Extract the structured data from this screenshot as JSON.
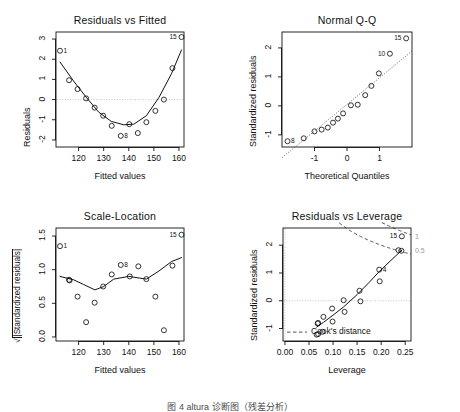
{
  "figure": {
    "caption": "图 4  altura 诊断图（残差分析）",
    "background": "#ffffff",
    "foreground": "#000000",
    "cook_color": "#9a9a9a",
    "guide_color": "#bdbdbd"
  },
  "panels": [
    {
      "id": "residuals-vs-fitted",
      "title": "Residuals vs Fitted",
      "xlabel": "Fitted values",
      "ylabel": "Residuals",
      "xticks": [
        "120",
        "130",
        "140",
        "150",
        "160"
      ],
      "yticks": [
        "3",
        "2",
        "1",
        "0",
        "-1",
        "-2"
      ]
    },
    {
      "id": "normal-qq",
      "title": "Normal Q-Q",
      "xlabel": "Theoretical Quantiles",
      "ylabel": "Standardized residuals",
      "xticks": [
        "-1",
        "0",
        "1"
      ],
      "yticks": [
        "2",
        "1",
        "0",
        "-1"
      ]
    },
    {
      "id": "scale-location",
      "title": "Scale-Location",
      "xlabel": "Fitted values",
      "ylabel": "|Standardized residuals|",
      "ylabel_prefix": "sqrt",
      "xticks": [
        "120",
        "130",
        "140",
        "150",
        "160"
      ],
      "yticks": [
        "1.5",
        "1.0",
        "0.5",
        "0.0"
      ]
    },
    {
      "id": "residuals-vs-leverage",
      "title": "Residuals vs Leverage",
      "xlabel": "Leverage",
      "ylabel": "Standardized residuals",
      "xticks": [
        "0.00",
        "0.05",
        "0.10",
        "0.15",
        "0.20",
        "0.25"
      ],
      "yticks": [
        "2",
        "1",
        "0",
        "-1"
      ],
      "legend": "Cook's distance",
      "cook_labels": [
        "1",
        "0.5"
      ]
    }
  ],
  "chart_data": [
    {
      "type": "scatter",
      "id": "residuals-vs-fitted",
      "title": "Residuals vs Fitted",
      "xlabel": "Fitted values",
      "ylabel": "Residuals",
      "xlim": [
        111,
        162
      ],
      "ylim": [
        -2.35,
        3.35
      ],
      "xticks": [
        120,
        130,
        140,
        150,
        160
      ],
      "yticks": [
        -2,
        -1,
        0,
        1,
        2,
        3
      ],
      "grid": false,
      "hline": 0,
      "points": [
        {
          "x": 112.6,
          "y": 2.42,
          "label": "1"
        },
        {
          "x": 116.2,
          "y": 0.96,
          "label": ""
        },
        {
          "x": 119.6,
          "y": 0.52,
          "label": ""
        },
        {
          "x": 123.0,
          "y": 0.06,
          "label": ""
        },
        {
          "x": 126.4,
          "y": -0.4,
          "label": ""
        },
        {
          "x": 129.8,
          "y": -0.8,
          "label": ""
        },
        {
          "x": 133.2,
          "y": -1.3,
          "label": ""
        },
        {
          "x": 136.8,
          "y": -1.8,
          "label": "8"
        },
        {
          "x": 140.2,
          "y": -1.22,
          "label": ""
        },
        {
          "x": 143.6,
          "y": -1.66,
          "label": ""
        },
        {
          "x": 147.0,
          "y": -1.12,
          "label": ""
        },
        {
          "x": 150.6,
          "y": -0.56,
          "label": ""
        },
        {
          "x": 154.0,
          "y": 0.0,
          "label": ""
        },
        {
          "x": 157.4,
          "y": 1.56,
          "label": ""
        },
        {
          "x": 161.0,
          "y": 3.1,
          "label": "15"
        }
      ],
      "smooth": [
        {
          "x": 112.6,
          "y": 1.86
        },
        {
          "x": 118.0,
          "y": 0.92
        },
        {
          "x": 123.0,
          "y": 0.12
        },
        {
          "x": 128.0,
          "y": -0.62
        },
        {
          "x": 133.0,
          "y": -1.08
        },
        {
          "x": 138.0,
          "y": -1.25
        },
        {
          "x": 142.0,
          "y": -1.22
        },
        {
          "x": 147.0,
          "y": -0.8
        },
        {
          "x": 152.0,
          "y": 0.1
        },
        {
          "x": 157.0,
          "y": 1.28
        },
        {
          "x": 161.0,
          "y": 2.46
        }
      ]
    },
    {
      "type": "scatter",
      "id": "normal-qq",
      "title": "Normal Q-Q",
      "xlabel": "Theoretical Quantiles",
      "ylabel": "Standardized residuals",
      "xlim": [
        -2.0,
        2.0
      ],
      "ylim": [
        -1.42,
        2.55
      ],
      "xticks": [
        -1,
        0,
        1
      ],
      "yticks": [
        -1,
        0,
        1,
        2
      ],
      "grid": false,
      "refline": {
        "slope": 0.92,
        "intercept": 0.05,
        "style": "dotted"
      },
      "points": [
        {
          "x": -1.83,
          "y": -1.22,
          "label": "8"
        },
        {
          "x": -1.33,
          "y": -1.12,
          "label": ""
        },
        {
          "x": -1.0,
          "y": -0.88,
          "label": ""
        },
        {
          "x": -0.78,
          "y": -0.82,
          "label": ""
        },
        {
          "x": -0.59,
          "y": -0.75,
          "label": ""
        },
        {
          "x": -0.43,
          "y": -0.58,
          "label": ""
        },
        {
          "x": -0.28,
          "y": -0.44,
          "label": ""
        },
        {
          "x": -0.12,
          "y": -0.26,
          "label": ""
        },
        {
          "x": 0.12,
          "y": 0.02,
          "label": ""
        },
        {
          "x": 0.33,
          "y": 0.04,
          "label": ""
        },
        {
          "x": 0.56,
          "y": 0.37,
          "label": ""
        },
        {
          "x": 0.75,
          "y": 0.69,
          "label": ""
        },
        {
          "x": 0.98,
          "y": 1.12,
          "label": ""
        },
        {
          "x": 1.32,
          "y": 1.8,
          "label": "10"
        },
        {
          "x": 1.82,
          "y": 2.33,
          "label": "15"
        }
      ]
    },
    {
      "type": "scatter",
      "id": "scale-location",
      "title": "Scale-Location",
      "xlabel": "Fitted values",
      "ylabel": "sqrt(|Standardized residuals|)",
      "xlim": [
        111,
        162
      ],
      "ylim": [
        -0.06,
        1.62
      ],
      "xticks": [
        120,
        130,
        140,
        150,
        160
      ],
      "yticks": [
        0.0,
        0.5,
        1.0,
        1.5
      ],
      "grid": false,
      "points": [
        {
          "x": 112.6,
          "y": 1.35,
          "label": "1"
        },
        {
          "x": 116.2,
          "y": 0.85,
          "label": ""
        },
        {
          "x": 116.4,
          "y": 0.84,
          "label": ""
        },
        {
          "x": 119.6,
          "y": 0.6,
          "label": ""
        },
        {
          "x": 123.0,
          "y": 0.22,
          "label": ""
        },
        {
          "x": 126.4,
          "y": 0.51,
          "label": ""
        },
        {
          "x": 129.8,
          "y": 0.75,
          "label": ""
        },
        {
          "x": 133.2,
          "y": 0.93,
          "label": ""
        },
        {
          "x": 136.8,
          "y": 1.07,
          "label": "8"
        },
        {
          "x": 140.4,
          "y": 0.9,
          "label": ""
        },
        {
          "x": 143.8,
          "y": 1.05,
          "label": ""
        },
        {
          "x": 147.0,
          "y": 0.86,
          "label": ""
        },
        {
          "x": 150.6,
          "y": 0.6,
          "label": ""
        },
        {
          "x": 154.0,
          "y": 0.1,
          "label": ""
        },
        {
          "x": 157.4,
          "y": 1.06,
          "label": ""
        },
        {
          "x": 161.0,
          "y": 1.52,
          "label": "15"
        }
      ],
      "smooth": [
        {
          "x": 112.6,
          "y": 0.9
        },
        {
          "x": 118.0,
          "y": 0.85
        },
        {
          "x": 122.0,
          "y": 0.78
        },
        {
          "x": 126.5,
          "y": 0.7
        },
        {
          "x": 130.0,
          "y": 0.75
        },
        {
          "x": 134.0,
          "y": 0.86
        },
        {
          "x": 140.0,
          "y": 0.9
        },
        {
          "x": 147.0,
          "y": 0.86
        },
        {
          "x": 152.0,
          "y": 0.98
        },
        {
          "x": 157.0,
          "y": 1.12
        },
        {
          "x": 161.0,
          "y": 1.18
        }
      ]
    },
    {
      "type": "scatter",
      "id": "residuals-vs-leverage",
      "title": "Residuals vs Leverage",
      "xlabel": "Leverage",
      "ylabel": "Standardized residuals",
      "xlim": [
        -0.004,
        0.262
      ],
      "ylim": [
        -1.45,
        2.62
      ],
      "xticks": [
        0.0,
        0.05,
        0.1,
        0.15,
        0.2,
        0.25
      ],
      "yticks": [
        -1,
        0,
        1,
        2
      ],
      "grid": false,
      "hline": 0,
      "vline": 0,
      "legend": "Cook's distance",
      "cook_levels": [
        0.5,
        1.0
      ],
      "cook_labels": [
        "1",
        "0.5"
      ],
      "points": [
        {
          "x": 0.066,
          "y": -1.22,
          "label": ""
        },
        {
          "x": 0.069,
          "y": -1.2,
          "label": ""
        },
        {
          "x": 0.068,
          "y": -0.82,
          "label": ""
        },
        {
          "x": 0.069,
          "y": -0.8,
          "label": ""
        },
        {
          "x": 0.078,
          "y": -1.12,
          "label": ""
        },
        {
          "x": 0.08,
          "y": -0.58,
          "label": ""
        },
        {
          "x": 0.098,
          "y": -0.28,
          "label": ""
        },
        {
          "x": 0.099,
          "y": -0.75,
          "label": ""
        },
        {
          "x": 0.122,
          "y": 0.02,
          "label": ""
        },
        {
          "x": 0.124,
          "y": -0.4,
          "label": ""
        },
        {
          "x": 0.155,
          "y": 0.36,
          "label": ""
        },
        {
          "x": 0.157,
          "y": -0.02,
          "label": ""
        },
        {
          "x": 0.196,
          "y": 1.12,
          "label": "4"
        },
        {
          "x": 0.197,
          "y": 0.7,
          "label": ""
        },
        {
          "x": 0.236,
          "y": 1.82,
          "label": ""
        },
        {
          "x": 0.242,
          "y": 1.8,
          "label": ""
        },
        {
          "x": 0.243,
          "y": 2.32,
          "label": "15"
        }
      ],
      "smooth": [
        {
          "x": 0.066,
          "y": -0.95
        },
        {
          "x": 0.08,
          "y": -0.78
        },
        {
          "x": 0.1,
          "y": -0.52
        },
        {
          "x": 0.122,
          "y": -0.22
        },
        {
          "x": 0.15,
          "y": 0.22
        },
        {
          "x": 0.175,
          "y": 0.66
        },
        {
          "x": 0.196,
          "y": 1.05
        },
        {
          "x": 0.22,
          "y": 1.45
        },
        {
          "x": 0.243,
          "y": 1.82
        }
      ]
    }
  ]
}
